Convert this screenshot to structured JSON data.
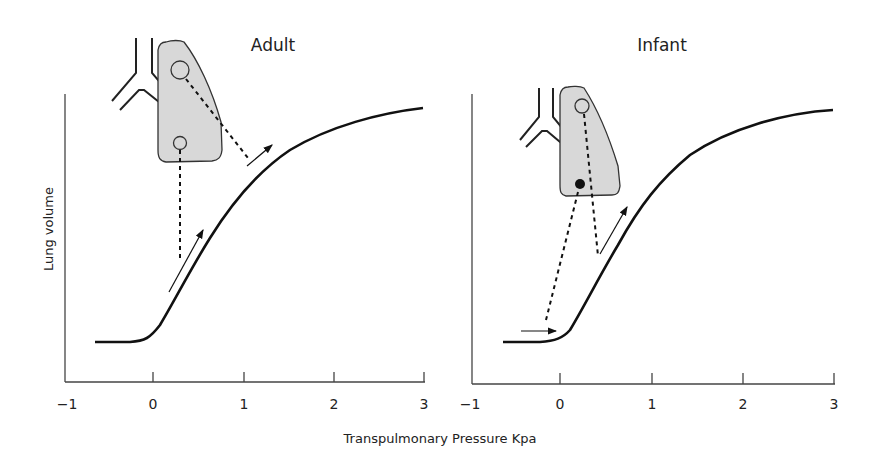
{
  "figure": {
    "xlabel": "Transpulmonary Pressure Kpa",
    "ylabel": "Lung volume",
    "panels": [
      {
        "title": "Adult",
        "xticks": [
          "−1",
          "0",
          "1",
          "2",
          "3"
        ]
      },
      {
        "title": "Infant",
        "xticks": [
          "−1",
          "0",
          "1",
          "2",
          "3"
        ]
      }
    ],
    "colors": {
      "lung_fill": "#d8d8d8",
      "line": "#111111"
    }
  }
}
